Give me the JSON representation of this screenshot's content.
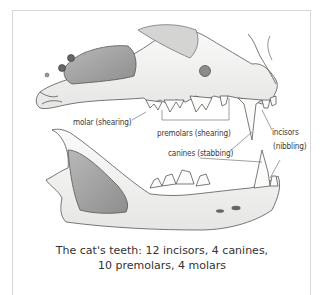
{
  "figure": {
    "labels": {
      "molar": "molar (shearing)",
      "premolars": "premolars (shearing)",
      "canines": "canines (stabbing)",
      "incisors_line1": "incisors",
      "incisors_line2": "(nibbling)"
    },
    "caption": {
      "line1": "The cat's teeth: 12 incisors, 4 canines,",
      "line2": "10 premolars, 4 molars"
    },
    "colors": {
      "ink": "#3a3a3a",
      "bone": "#f4f4f2",
      "shade": "#a9a9a9",
      "frame": "#d8d8d8"
    }
  }
}
